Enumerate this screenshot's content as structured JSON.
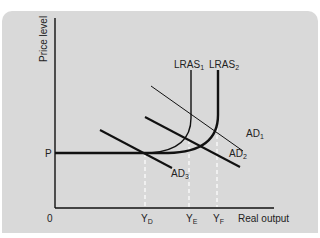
{
  "diagram": {
    "type": "economics-ad-lras",
    "y_axis_label": "Price level",
    "x_axis_label": "Real output",
    "origin_label": "0",
    "price_label": "P",
    "curves": {
      "lras1": {
        "base": "LRAS",
        "sub": "1"
      },
      "lras2": {
        "base": "LRAS",
        "sub": "2"
      },
      "ad1": {
        "base": "AD",
        "sub": "1"
      },
      "ad2": {
        "base": "AD",
        "sub": "2"
      },
      "ad3": {
        "base": "AD",
        "sub": "3"
      }
    },
    "x_ticks": {
      "yd": {
        "base": "Y",
        "sub": "D"
      },
      "ye": {
        "base": "Y",
        "sub": "E"
      },
      "yf": {
        "base": "Y",
        "sub": "F"
      }
    },
    "colors": {
      "background": "#d9d9d9",
      "line": "#111111",
      "dashed": "#ffffff"
    }
  }
}
